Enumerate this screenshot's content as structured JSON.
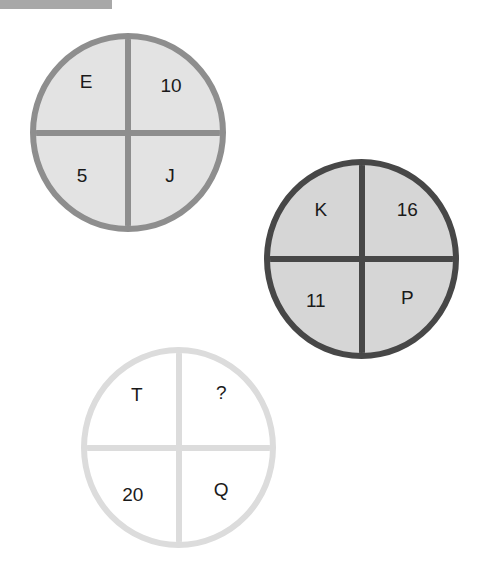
{
  "header": {
    "label": ""
  },
  "puzzles": [
    {
      "name": "circle-1",
      "border_color": "#8e8e8e",
      "fill_color": "#e3e3e3",
      "cells": {
        "top_left": "E",
        "top_right": "10",
        "bottom_left": "5",
        "bottom_right": "J"
      }
    },
    {
      "name": "circle-2",
      "border_color": "#474747",
      "fill_color": "#d6d6d6",
      "cells": {
        "top_left": "K",
        "top_right": "16",
        "bottom_left": "11",
        "bottom_right": "P"
      }
    },
    {
      "name": "circle-3",
      "border_color": "#dcdcdc",
      "fill_color": "#ffffff",
      "cells": {
        "top_left": "T",
        "top_right": "?",
        "bottom_left": "20",
        "bottom_right": "Q"
      }
    }
  ]
}
